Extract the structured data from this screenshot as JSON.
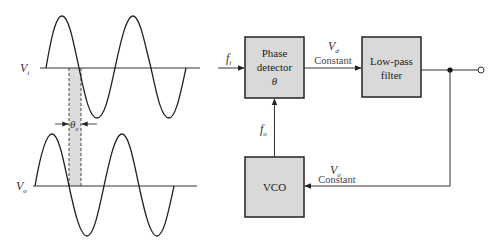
{
  "waveforms": {
    "input": {
      "label_main": "V",
      "label_sub": "i"
    },
    "output": {
      "label_main": "V",
      "label_sub": "o"
    },
    "phase_error": {
      "label_main": "θ",
      "label_sub": "e"
    }
  },
  "blocks": {
    "phase_detector": {
      "line1": "Phase",
      "line2": "detector",
      "line3": "θ"
    },
    "low_pass_filter": {
      "line1": "Low-pass",
      "line2": "filter"
    },
    "vco": {
      "label": "VCO"
    }
  },
  "signals": {
    "input_freq": {
      "label_main": "f",
      "label_sub": "i"
    },
    "feedback_freq": {
      "label_main": "f",
      "label_sub": "o"
    },
    "detector_out": {
      "label_main": "V",
      "label_sub": "d",
      "note": "Constant"
    },
    "control_voltage": {
      "label_main": "V",
      "label_sub": "o",
      "note": "Constant"
    }
  },
  "colors": {
    "block_fill": "#d9d9d9",
    "stroke": "#222222",
    "shade": "#dcdcdc"
  }
}
